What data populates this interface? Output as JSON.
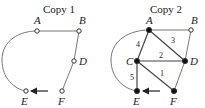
{
  "diagrams": [
    {
      "title": "Copy 1",
      "title_pos": [
        43,
        13
      ],
      "vertices": [
        {
          "id": "A",
          "label": "A",
          "x": 37,
          "y": 31,
          "filled": false,
          "lx": 34,
          "ly": 24
        },
        {
          "id": "B",
          "label": "B",
          "x": 79,
          "y": 31,
          "filled": false,
          "lx": 79,
          "ly": 24
        },
        {
          "id": "D",
          "label": "D",
          "x": 74,
          "y": 61,
          "filled": false,
          "lx": 79,
          "ly": 65
        },
        {
          "id": "E",
          "label": "E",
          "x": 26,
          "y": 91,
          "filled": false,
          "lx": 21,
          "ly": 105
        },
        {
          "id": "F",
          "label": "F",
          "x": 62,
          "y": 91,
          "filled": false,
          "lx": 58,
          "ly": 105
        }
      ],
      "edges": [
        {
          "from": "A",
          "to": "B",
          "label": ""
        },
        {
          "from": "B",
          "to": "D",
          "label": ""
        },
        {
          "from": "D",
          "to": "F",
          "label": ""
        }
      ],
      "arc": {
        "from": "A",
        "to": "E",
        "path": "M37,31 C20,31 2,40 2,60 C2,78 14,89 26,91"
      },
      "arrow": {
        "x1": 48,
        "y1": 91,
        "x2": 31,
        "y2": 91,
        "direction": "left"
      }
    },
    {
      "title": "Copy 2",
      "title_pos": [
        150,
        13
      ],
      "vertices": [
        {
          "id": "A",
          "label": "A",
          "x": 149,
          "y": 30,
          "filled": true,
          "lx": 146,
          "ly": 24
        },
        {
          "id": "B",
          "label": "B",
          "x": 191,
          "y": 30,
          "filled": false,
          "lx": 191,
          "ly": 24
        },
        {
          "id": "C",
          "label": "C",
          "x": 137,
          "y": 61,
          "filled": true,
          "lx": 126,
          "ly": 65
        },
        {
          "id": "D",
          "label": "D",
          "x": 185,
          "y": 61,
          "filled": true,
          "lx": 190,
          "ly": 65
        },
        {
          "id": "E",
          "label": "E",
          "x": 137,
          "y": 91,
          "filled": true,
          "lx": 133,
          "ly": 105
        },
        {
          "id": "F",
          "label": "F",
          "x": 174,
          "y": 91,
          "filled": true,
          "lx": 170,
          "ly": 105
        }
      ],
      "edges": [
        {
          "from": "A",
          "to": "B",
          "label": ""
        },
        {
          "from": "B",
          "to": "D",
          "label": ""
        },
        {
          "from": "D",
          "to": "F",
          "label": ""
        },
        {
          "from": "A",
          "to": "C",
          "label": "4",
          "lx": 136,
          "ly": 47
        },
        {
          "from": "A",
          "to": "D",
          "label": "3",
          "lx": 171,
          "ly": 43
        },
        {
          "from": "C",
          "to": "D",
          "label": "2",
          "lx": 159,
          "ly": 58
        },
        {
          "from": "C",
          "to": "F",
          "label": "1",
          "lx": 160,
          "ly": 76
        },
        {
          "from": "C",
          "to": "E",
          "label": "5",
          "lx": 130,
          "ly": 80
        }
      ],
      "arc": {
        "from": "A",
        "to": "E",
        "path": "M149,30 C130,30 111,40 111,60 C111,78 124,89 137,91"
      },
      "arrow": {
        "x1": 160,
        "y1": 91,
        "x2": 143,
        "y2": 91,
        "direction": "left"
      }
    }
  ]
}
